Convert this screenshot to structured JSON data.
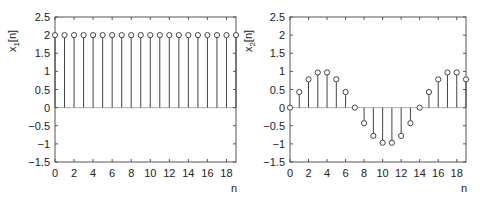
{
  "chart_data": [
    {
      "type": "stem",
      "title": "",
      "xlabel": "n",
      "ylabel": "x1[n]",
      "ylabel_main": "x",
      "ylabel_sub": "1",
      "ylabel_rest": "[n]",
      "xlim": [
        0,
        19
      ],
      "ylim": [
        -1.5,
        2.5
      ],
      "xticks": [
        0,
        2,
        4,
        6,
        8,
        10,
        12,
        14,
        16,
        18
      ],
      "yticks": [
        -1.5,
        -1,
        -0.5,
        0,
        0.5,
        1,
        1.5,
        2,
        2.5
      ],
      "ytick_labels": [
        "−1.5",
        "−1",
        "−0.5",
        "0",
        "0.5",
        "1",
        "1.5",
        "2",
        "2.5"
      ],
      "grid": false,
      "x": [
        0,
        1,
        2,
        3,
        4,
        5,
        6,
        7,
        8,
        9,
        10,
        11,
        12,
        13,
        14,
        15,
        16,
        17,
        18,
        19
      ],
      "values": [
        2,
        2,
        2,
        2,
        2,
        2,
        2,
        2,
        2,
        2,
        2,
        2,
        2,
        2,
        2,
        2,
        2,
        2,
        2,
        2
      ]
    },
    {
      "type": "stem",
      "title": "",
      "xlabel": "n",
      "ylabel": "x2[n]",
      "ylabel_main": "x",
      "ylabel_sub": "2",
      "ylabel_rest": "[n]",
      "xlim": [
        0,
        19
      ],
      "ylim": [
        -1.5,
        2.5
      ],
      "xticks": [
        0,
        2,
        4,
        6,
        8,
        10,
        12,
        14,
        16,
        18
      ],
      "yticks": [
        -1.5,
        -1,
        -0.5,
        0,
        0.5,
        1,
        1.5,
        2,
        2.5
      ],
      "ytick_labels": [
        "−1.5",
        "−1",
        "−0.5",
        "0",
        "0.5",
        "1",
        "1.5",
        "2",
        "2.5"
      ],
      "grid": false,
      "x": [
        0,
        1,
        2,
        3,
        4,
        5,
        6,
        7,
        8,
        9,
        10,
        11,
        12,
        13,
        14,
        15,
        16,
        17,
        18,
        19
      ],
      "values": [
        0,
        0.43,
        0.78,
        0.97,
        0.97,
        0.78,
        0.43,
        0,
        -0.43,
        -0.78,
        -0.97,
        -0.97,
        -0.78,
        -0.43,
        0,
        0.43,
        0.78,
        0.97,
        0.97,
        0.78
      ]
    }
  ],
  "colors": {
    "axis": "#555555",
    "stem": "#444444",
    "marker": "#444444"
  }
}
